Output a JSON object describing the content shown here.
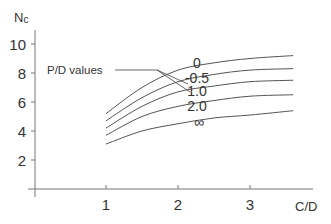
{
  "chart_data": {
    "type": "line",
    "title": "",
    "xlabel": "C/D",
    "ylabel": "Nc",
    "xlim": [
      0,
      3.6
    ],
    "ylim": [
      0,
      11
    ],
    "x_ticks": [
      1,
      2,
      3
    ],
    "y_ticks": [
      2,
      4,
      6,
      8,
      10
    ],
    "grid": false,
    "legend_title": "P/D values",
    "x": [
      1.0,
      1.5,
      2.0,
      2.5,
      3.0,
      3.6
    ],
    "series": [
      {
        "name": "0",
        "values": [
          5.2,
          7.0,
          8.2,
          8.7,
          9.0,
          9.2
        ]
      },
      {
        "name": "0.5",
        "values": [
          4.7,
          6.3,
          7.4,
          7.9,
          8.2,
          8.3
        ]
      },
      {
        "name": "1.0",
        "values": [
          4.2,
          5.7,
          6.7,
          7.1,
          7.4,
          7.5
        ]
      },
      {
        "name": "2.0",
        "values": [
          3.7,
          5.0,
          5.7,
          6.1,
          6.4,
          6.5
        ]
      },
      {
        "name": "∞",
        "values": [
          3.1,
          4.0,
          4.5,
          4.9,
          5.1,
          5.4
        ]
      }
    ],
    "line_color": "#555555"
  },
  "axes": {
    "x_label": "C/D",
    "y_label_main": "N",
    "y_label_sub": "c",
    "x_tick_labels": [
      "1",
      "2",
      "3"
    ],
    "y_tick_labels": [
      "2",
      "4",
      "6",
      "8",
      "10"
    ]
  },
  "annotations": {
    "legend_title": "P/D values",
    "curve_labels": [
      "0",
      "-0.5",
      "1.0",
      "2.0",
      "∞"
    ]
  }
}
